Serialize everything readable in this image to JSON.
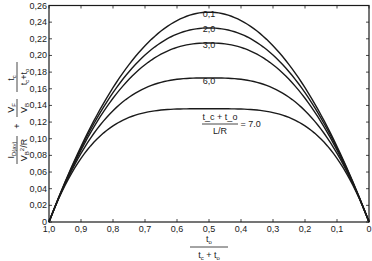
{
  "chart_data": {
    "type": "line",
    "title": "",
    "xlabel": "t_o / (t_c + t_o)",
    "ylabel": "I_D(av) / (V_B²/R) + (V_F/V_B) · t_c/(t_c + t_o)",
    "xlim": [
      1.0,
      0.0
    ],
    "ylim": [
      0,
      0.26
    ],
    "x_reversed": true,
    "grid": false,
    "legend_position": "inline labels on curves",
    "x_ticks": [
      "1,0",
      "0,9",
      "0,8",
      "0,7",
      "0,6",
      "0,5",
      "0,4",
      "0,3",
      "0,2",
      "0,1",
      "0"
    ],
    "y_ticks": [
      "0",
      "0,02",
      "0,04",
      "0,06",
      "0,08",
      "0,10",
      "0,12",
      "0,14",
      "0,16",
      "0,18",
      "0,20",
      "0,22",
      "0,24",
      "0,26"
    ],
    "parameter_label": {
      "numerator": "t_c + t_o",
      "denominator": "L/R"
    },
    "x": [
      1.0,
      0.9,
      0.8,
      0.7,
      0.6,
      0.5,
      0.4,
      0.3,
      0.2,
      0.1,
      0.0
    ],
    "series": [
      {
        "name": "0,1",
        "peak": 0.252,
        "shape": 2.0,
        "values": [
          0,
          0.091,
          0.161,
          0.212,
          0.242,
          0.252,
          0.242,
          0.212,
          0.161,
          0.091,
          0
        ]
      },
      {
        "name": "2,0",
        "peak": 0.233,
        "shape": 2.15,
        "values": [
          0,
          0.091,
          0.159,
          0.203,
          0.227,
          0.233,
          0.227,
          0.203,
          0.159,
          0.091,
          0
        ]
      },
      {
        "name": "3,0",
        "peak": 0.215,
        "shape": 2.3,
        "values": [
          0,
          0.09,
          0.153,
          0.192,
          0.211,
          0.215,
          0.211,
          0.192,
          0.153,
          0.09,
          0
        ]
      },
      {
        "name": "6,0",
        "peak": 0.173,
        "shape": 2.9,
        "values": [
          0,
          0.083,
          0.134,
          0.161,
          0.171,
          0.173,
          0.171,
          0.161,
          0.134,
          0.083,
          0
        ]
      },
      {
        "name": "7,0",
        "peak": 0.136,
        "shape": 3.7,
        "values": [
          0,
          0.076,
          0.115,
          0.131,
          0.135,
          0.136,
          0.135,
          0.131,
          0.115,
          0.076,
          0
        ]
      }
    ],
    "curve_labels": [
      {
        "text": "0,1",
        "x": 0.5,
        "y": 0.246
      },
      {
        "text": "2,0",
        "x": 0.5,
        "y": 0.228
      },
      {
        "text": "3,0",
        "x": 0.5,
        "y": 0.209
      },
      {
        "text": "6,0",
        "x": 0.5,
        "y": 0.166
      },
      {
        "text": "= 7.0",
        "x": 0.37,
        "y": 0.114
      }
    ],
    "colors": {
      "line": "#1a1a1a",
      "background": "#ffffff"
    }
  }
}
